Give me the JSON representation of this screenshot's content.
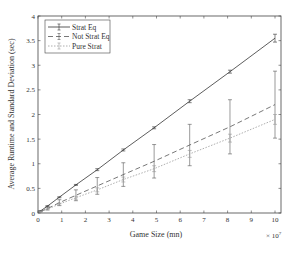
{
  "chart_data": {
    "type": "line",
    "title": "",
    "xlabel": "Game Size (mn)",
    "ylabel": "Average Runtime and Standard Deviation (sec)",
    "x_multiplier": "× 10^7",
    "xlim": [
      0,
      10
    ],
    "ylim": [
      0,
      4
    ],
    "xticks": [
      0,
      1,
      2,
      3,
      4,
      5,
      6,
      7,
      8,
      9,
      10
    ],
    "yticks": [
      0,
      0.5,
      1,
      1.5,
      2,
      2.5,
      3,
      3.5,
      4
    ],
    "ytick_labels": [
      "0",
      "0.5",
      "1",
      "1.5",
      "2",
      "2.5",
      "3",
      "3.5",
      "4"
    ],
    "grid": false,
    "legend_position": "upper left",
    "x": [
      0.1,
      0.4,
      0.9,
      1.6,
      2.5,
      3.6,
      4.9,
      6.4,
      8.1,
      10
    ],
    "series": [
      {
        "name": "Strat Eq",
        "style": "solid",
        "color": "#333333",
        "values": [
          0.04,
          0.14,
          0.32,
          0.57,
          0.88,
          1.28,
          1.73,
          2.27,
          2.87,
          3.55
        ],
        "err": [
          0.01,
          0.01,
          0.01,
          0.01,
          0.02,
          0.02,
          0.02,
          0.03,
          0.03,
          0.08
        ]
      },
      {
        "name": "Not Strat Eq",
        "style": "dashed",
        "color": "#555555",
        "values": [
          0.03,
          0.09,
          0.21,
          0.36,
          0.55,
          0.78,
          1.05,
          1.38,
          1.75,
          2.2
        ],
        "err": [
          0.01,
          0.03,
          0.06,
          0.11,
          0.17,
          0.24,
          0.34,
          0.42,
          0.55,
          0.68
        ]
      },
      {
        "name": "Pure Strat",
        "style": "dotted",
        "color": "#999999",
        "values": [
          0.03,
          0.08,
          0.18,
          0.31,
          0.47,
          0.68,
          0.9,
          1.2,
          1.52,
          1.9
        ],
        "err": [
          0.005,
          0.01,
          0.02,
          0.03,
          0.04,
          0.05,
          0.06,
          0.07,
          0.08,
          0.1
        ]
      }
    ]
  }
}
